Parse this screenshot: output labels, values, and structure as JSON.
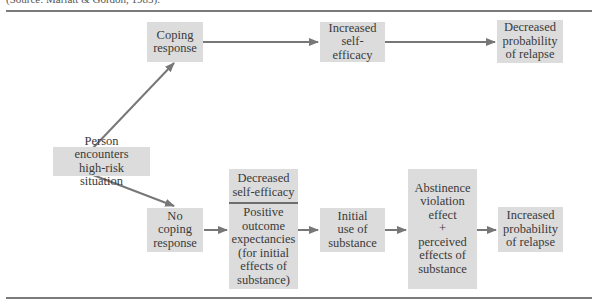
{
  "caption": "(Source: Marlatt & Gordon, 1985).",
  "colors": {
    "box_fill": "#dcdcdc",
    "arrow": "#777777",
    "rule": "#7a7a7a",
    "text": "#3a3a3a"
  },
  "nodes": {
    "start": {
      "lines": [
        "Person encounters",
        "high-risk situation"
      ]
    },
    "coping": {
      "lines": [
        "Coping",
        "response"
      ]
    },
    "increased_self_efficacy": {
      "lines": [
        "Increased",
        "self-efficacy"
      ]
    },
    "decreased_relapse": {
      "lines": [
        "Decreased",
        "probability",
        "of relapse"
      ]
    },
    "no_coping": {
      "lines": [
        "No",
        "coping",
        "response"
      ]
    },
    "decreased_self_efficacy": {
      "lines": [
        "Decreased",
        "self-efficacy"
      ]
    },
    "positive_outcome": {
      "lines": [
        "Positive",
        "outcome",
        "expectancies",
        "(for initial",
        "effects of",
        "substance)"
      ]
    },
    "initial_use": {
      "lines": [
        "Initial",
        "use of",
        "substance"
      ]
    },
    "abstinence": {
      "lines": [
        "Abstinence",
        "violation",
        "effect",
        "+",
        "perceived",
        "effects of",
        "substance"
      ]
    },
    "increased_relapse": {
      "lines": [
        "Increased",
        "probability",
        "of relapse"
      ]
    }
  },
  "edges": [
    {
      "from": "start",
      "to": "coping"
    },
    {
      "from": "coping",
      "to": "increased_self_efficacy"
    },
    {
      "from": "increased_self_efficacy",
      "to": "decreased_relapse"
    },
    {
      "from": "start",
      "to": "no_coping"
    },
    {
      "from": "no_coping",
      "to": "decreased_self_efficacy"
    },
    {
      "from": "decreased_self_efficacy",
      "to": "initial_use"
    },
    {
      "from": "initial_use",
      "to": "abstinence"
    },
    {
      "from": "abstinence",
      "to": "increased_relapse"
    }
  ]
}
